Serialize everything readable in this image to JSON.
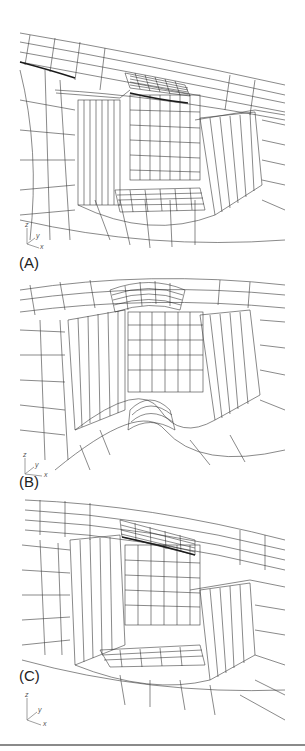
{
  "figure": {
    "panels": [
      {
        "id": "A",
        "label": "(A)",
        "axes": {
          "z": "z",
          "y": "y",
          "x": "x"
        }
      },
      {
        "id": "B",
        "label": "(B)",
        "axes": {
          "z": "z",
          "y": "y",
          "x": "x"
        }
      },
      {
        "id": "C",
        "label": "(C)",
        "axes": {
          "z": "z",
          "y": "y",
          "x": "x"
        }
      }
    ],
    "colors": {
      "mesh_line": "#3a3a3a",
      "dense_mesh": "#1a1a1a",
      "background": "#ffffff",
      "rule": "#8a8a8a"
    }
  }
}
